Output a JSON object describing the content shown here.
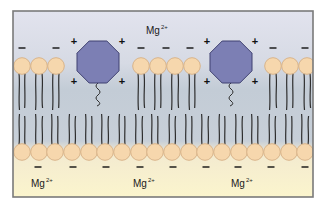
{
  "diagram": {
    "frame": {
      "x": 13,
      "y": 11,
      "width": 300,
      "height": 186,
      "border_color": "#7a7a7a"
    },
    "colors": {
      "background_top": "#e2e3ee",
      "background_middle": "#c3ccd6",
      "background_bottom": "#fbf5cd",
      "lipid_head_fill": "#f6d7ad",
      "lipid_head_stroke": "#d9b48a",
      "lipid_tail": "#2e2e2e",
      "protein_fill": "#7c7fb4",
      "protein_stroke": "#3e4070",
      "charge_text": "#111111"
    },
    "ions": [
      {
        "label": "Mg",
        "charge": "2+",
        "x": 146,
        "y": 24,
        "side": "outer"
      },
      {
        "label": "Mg",
        "charge": "2+",
        "x": 31,
        "y": 177,
        "side": "inner"
      },
      {
        "label": "Mg",
        "charge": "2+",
        "x": 133,
        "y": 177,
        "side": "inner"
      },
      {
        "label": "Mg",
        "charge": "2+",
        "x": 231,
        "y": 177,
        "side": "inner"
      }
    ],
    "top_leaflet": {
      "head_y": 66,
      "head_radius": 8.3,
      "heads_x": [
        22,
        39,
        56,
        141,
        158,
        175,
        192,
        273,
        290,
        307
      ],
      "negative_charges": [
        {
          "x": 22,
          "y": 48
        },
        {
          "x": 56,
          "y": 48
        },
        {
          "x": 141,
          "y": 48
        },
        {
          "x": 166,
          "y": 48
        },
        {
          "x": 190,
          "y": 48
        },
        {
          "x": 273,
          "y": 48
        },
        {
          "x": 305,
          "y": 48
        }
      ]
    },
    "bottom_leaflet": {
      "head_y": 152,
      "head_radius": 8.3,
      "heads_x": [
        22,
        39,
        55,
        72,
        89,
        105,
        122,
        139,
        155,
        172,
        189,
        205,
        222,
        239,
        255,
        272,
        289,
        305
      ],
      "negative_charges": [
        {
          "x": 38,
          "y": 167
        },
        {
          "x": 73,
          "y": 167
        },
        {
          "x": 106,
          "y": 167
        },
        {
          "x": 140,
          "y": 167
        },
        {
          "x": 173,
          "y": 167
        },
        {
          "x": 206,
          "y": 167
        },
        {
          "x": 238,
          "y": 167
        },
        {
          "x": 271,
          "y": 167
        },
        {
          "x": 305,
          "y": 167
        }
      ]
    },
    "proteins": [
      {
        "name": "protein-1",
        "cx": 98,
        "cy": 62,
        "size": 42,
        "charges": [
          "+",
          "+",
          "+",
          "+"
        ]
      },
      {
        "name": "protein-2",
        "cx": 231,
        "cy": 62,
        "size": 42,
        "charges": [
          "+",
          "+",
          "+",
          "+"
        ]
      }
    ],
    "charge_symbols": {
      "positive": "+",
      "negative": "−"
    }
  }
}
